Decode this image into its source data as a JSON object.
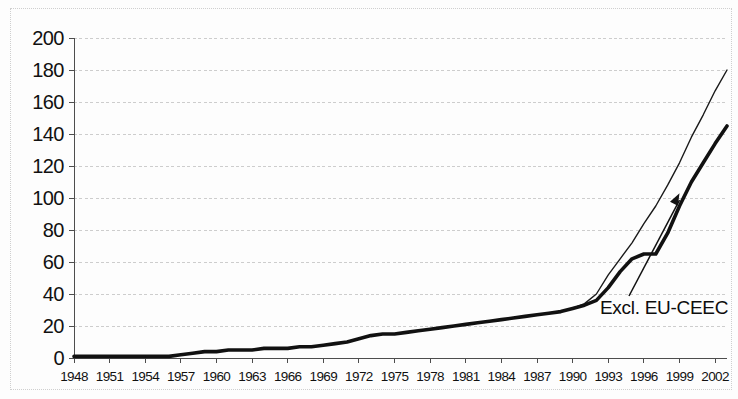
{
  "chart_data": {
    "type": "line",
    "title": "",
    "xlabel": "",
    "ylabel": "",
    "xlim": [
      1948,
      2003
    ],
    "ylim": [
      0,
      200
    ],
    "grid": true,
    "legend_position": "none",
    "y_ticks": [
      200,
      180,
      160,
      140,
      120,
      100,
      80,
      60,
      40,
      20,
      0
    ],
    "x_ticks": [
      1948,
      1951,
      1954,
      1957,
      1960,
      1963,
      1966,
      1969,
      1972,
      1975,
      1978,
      1981,
      1984,
      1987,
      1990,
      1993,
      1996,
      1999,
      2002
    ],
    "x": [
      1948,
      1949,
      1950,
      1951,
      1952,
      1953,
      1954,
      1955,
      1956,
      1957,
      1958,
      1959,
      1960,
      1961,
      1962,
      1963,
      1964,
      1965,
      1966,
      1967,
      1968,
      1969,
      1970,
      1971,
      1972,
      1973,
      1974,
      1975,
      1976,
      1977,
      1978,
      1979,
      1980,
      1981,
      1982,
      1983,
      1984,
      1985,
      1986,
      1987,
      1988,
      1989,
      1990,
      1991,
      1992,
      1993,
      1994,
      1995,
      1996,
      1997,
      1998,
      1999,
      2000,
      2001,
      2002,
      2003
    ],
    "series": [
      {
        "name": "Total",
        "style": "thin",
        "color": "#1a1a1a",
        "width": 1.4,
        "values": [
          1,
          1,
          1,
          1,
          1,
          1,
          1,
          1,
          1,
          2,
          3,
          4,
          4,
          5,
          5,
          5,
          6,
          6,
          6,
          7,
          7,
          8,
          9,
          10,
          12,
          14,
          15,
          15,
          16,
          17,
          18,
          19,
          20,
          21,
          22,
          23,
          24,
          25,
          26,
          27,
          28,
          29,
          31,
          34,
          40,
          52,
          62,
          72,
          84,
          95,
          108,
          122,
          138,
          152,
          167,
          180
        ]
      },
      {
        "name": "Excl. EU-CEEC",
        "style": "thick",
        "color": "#111111",
        "width": 3.6,
        "values": [
          1,
          1,
          1,
          1,
          1,
          1,
          1,
          1,
          1,
          2,
          3,
          4,
          4,
          5,
          5,
          5,
          6,
          6,
          6,
          7,
          7,
          8,
          9,
          10,
          12,
          14,
          15,
          15,
          16,
          17,
          18,
          19,
          20,
          21,
          22,
          23,
          24,
          25,
          26,
          27,
          28,
          29,
          31,
          33,
          36,
          44,
          54,
          62,
          65,
          65,
          78,
          95,
          110,
          122,
          134,
          145
        ]
      }
    ],
    "annotations": [
      {
        "text": "Excl. EU-CEEC",
        "target_x": 1999,
        "target_y": 103,
        "arrow": true
      }
    ]
  },
  "axis": {
    "y_labels": [
      "200",
      "180",
      "160",
      "140",
      "120",
      "100",
      "80",
      "60",
      "40",
      "20",
      "0"
    ],
    "x_labels": [
      "1948",
      "1951",
      "1954",
      "1957",
      "1960",
      "1963",
      "1966",
      "1969",
      "1972",
      "1975",
      "1978",
      "1981",
      "1984",
      "1987",
      "1990",
      "1993",
      "1996",
      "1999",
      "2002"
    ]
  },
  "annotation": {
    "label": "Excl. EU-CEEC"
  },
  "colors": {
    "axis": "#4d4d4d",
    "grid": "#c8c8c8",
    "series_thin": "#1a1a1a",
    "series_thick": "#111111",
    "text": "#111111",
    "background": "#fdfdfd"
  }
}
